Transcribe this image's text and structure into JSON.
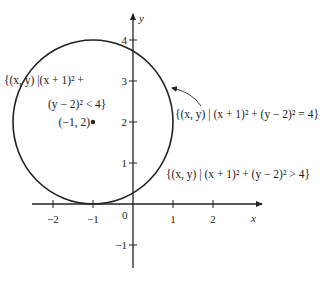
{
  "figure": {
    "type": "diagram",
    "axes": {
      "x_label": "x",
      "y_label": "y",
      "origin_label": "0",
      "x_range": [
        -2.5,
        3.1
      ],
      "y_range": [
        -1.5,
        4.6
      ],
      "x_ticks": [
        {
          "value": -2,
          "label": "−2"
        },
        {
          "value": -1,
          "label": "−1"
        },
        {
          "value": 1,
          "label": "1"
        },
        {
          "value": 2,
          "label": "2"
        }
      ],
      "y_ticks": [
        {
          "value": -1,
          "label": "−1"
        },
        {
          "value": 1,
          "label": "1"
        },
        {
          "value": 2,
          "label": "2"
        },
        {
          "value": 3,
          "label": "3"
        },
        {
          "value": 4,
          "label": "4"
        }
      ]
    },
    "circle": {
      "center": [
        -1,
        2
      ],
      "radius": 2
    },
    "center_point": {
      "label": "(−1, 2)"
    },
    "labels": {
      "interior_line1": "{(x, y) |(x + 1)² +",
      "interior_line2": "(y − 2)² < 4}",
      "boundary": "{(x, y) | (x + 1)² + (y − 2)² = 4}",
      "exterior": "{(x, y) | (x + 1)² + (y − 2)² > 4}"
    }
  }
}
